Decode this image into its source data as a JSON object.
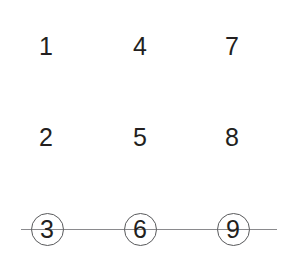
{
  "diagram": {
    "background_color": "#ffffff",
    "digit_color": "#231f20",
    "circle_color": "#58595b",
    "line_color": "#8a8a8d",
    "columns": 3,
    "rows": 3,
    "cells": [
      {
        "label": "1",
        "col": 1,
        "row": 1,
        "x": 46,
        "y": 46,
        "circled": false
      },
      {
        "label": "2",
        "col": 1,
        "row": 2,
        "x": 46,
        "y": 137,
        "circled": false
      },
      {
        "label": "3",
        "col": 1,
        "row": 3,
        "x": 47,
        "y": 229,
        "circled": true
      },
      {
        "label": "4",
        "col": 2,
        "row": 1,
        "x": 140,
        "y": 46,
        "circled": false
      },
      {
        "label": "5",
        "col": 2,
        "row": 2,
        "x": 140,
        "y": 137,
        "circled": false
      },
      {
        "label": "6",
        "col": 2,
        "row": 3,
        "x": 140,
        "y": 229,
        "circled": true
      },
      {
        "label": "7",
        "col": 3,
        "row": 1,
        "x": 232,
        "y": 46,
        "circled": false
      },
      {
        "label": "8",
        "col": 3,
        "row": 2,
        "x": 232,
        "y": 137,
        "circled": false
      },
      {
        "label": "9",
        "col": 3,
        "row": 3,
        "x": 233,
        "y": 229,
        "circled": true
      }
    ],
    "strike_line": {
      "x_start": 21,
      "x_end": 277,
      "y": 229
    }
  }
}
